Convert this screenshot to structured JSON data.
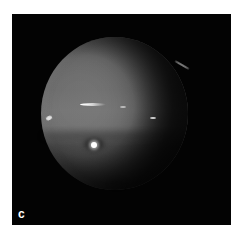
{
  "figure": {
    "panel_label": "c",
    "colors": {
      "background": "#030303",
      "page": "#ffffff",
      "planet_mid": "#6c6c6c",
      "planet_band": "#747474",
      "planet_south": "#3e3e3e",
      "highlight": "#ffffff"
    }
  }
}
